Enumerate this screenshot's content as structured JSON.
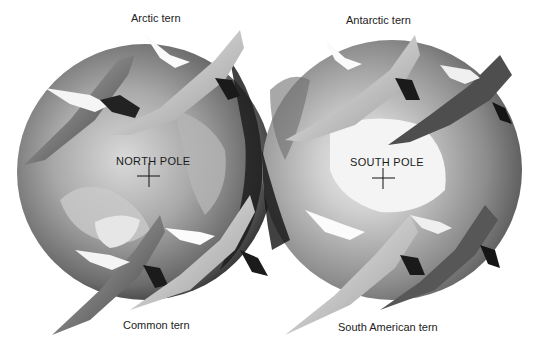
{
  "illustration": {
    "globes": [
      {
        "id": "north",
        "pole_label": "NORTH POLE",
        "cx": 145,
        "cy": 172,
        "r": 128
      },
      {
        "id": "south",
        "pole_label": "SOUTH POLE",
        "cx": 392,
        "cy": 170,
        "r": 130
      }
    ],
    "species_labels": [
      {
        "text": "Arctic tern",
        "x": 131,
        "y": 12
      },
      {
        "text": "Antarctic tern",
        "x": 346,
        "y": 14
      },
      {
        "text": "Common tern",
        "x": 123,
        "y": 319
      },
      {
        "text": "South American tern",
        "x": 338,
        "y": 321
      }
    ],
    "colors": {
      "background": "#ffffff",
      "globe_light": "#d8d8d8",
      "globe_mid": "#8a8a8a",
      "globe_dark": "#2a2a2a",
      "bird_light": "#e4e4e4",
      "bird_dark": "#1e1e1e"
    }
  }
}
